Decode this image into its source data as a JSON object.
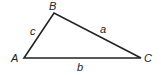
{
  "diagram": {
    "type": "triangle",
    "stroke_color": "#222222",
    "background": "#ffffff",
    "vertices": [
      {
        "label": "A",
        "x": 24,
        "y": 58
      },
      {
        "label": "B",
        "x": 54,
        "y": 13
      },
      {
        "label": "C",
        "x": 141,
        "y": 58
      }
    ],
    "sides": [
      {
        "label": "a",
        "from": "B",
        "to": "C"
      },
      {
        "label": "b",
        "from": "A",
        "to": "C"
      },
      {
        "label": "c",
        "from": "A",
        "to": "B"
      }
    ],
    "labels": {
      "vertex_a": "A",
      "vertex_b": "B",
      "vertex_c": "C",
      "side_a": "a",
      "side_b": "b",
      "side_c": "c"
    }
  }
}
